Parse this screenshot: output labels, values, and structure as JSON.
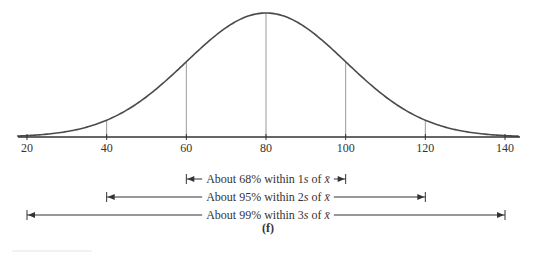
{
  "chart_data": {
    "type": "line",
    "title": "",
    "subtitle": "",
    "xlabel": "",
    "ylabel": "",
    "distribution": "normal",
    "mean": 80,
    "std_dev": 20,
    "xlim": [
      20,
      140
    ],
    "x_ticks": [
      20,
      40,
      60,
      80,
      100,
      120,
      140
    ],
    "x_tick_labels": [
      "20",
      "40",
      "60",
      "80",
      "100",
      "120",
      "140"
    ],
    "vertical_lines_at": [
      40,
      60,
      80,
      100,
      120
    ],
    "grid": false,
    "legend": null,
    "annotations": [
      {
        "text_prefix": "About 68% within 1",
        "italic_s": "s",
        "suffix": " of ",
        "xbar": "x̄",
        "range": [
          60,
          100
        ]
      },
      {
        "text_prefix": "About 95% within 2",
        "italic_s": "s",
        "suffix": " of ",
        "xbar": "x̄",
        "range": [
          40,
          120
        ]
      },
      {
        "text_prefix": "About 99% within 3",
        "italic_s": "s",
        "suffix": " of ",
        "xbar": "x̄",
        "range": [
          20,
          140
        ]
      }
    ],
    "figure_label": "(f)"
  },
  "colors": {
    "curve": "#4a4a4a",
    "axis": "#333333",
    "guide_lines": "#9a9a9a",
    "text": "#333333"
  }
}
